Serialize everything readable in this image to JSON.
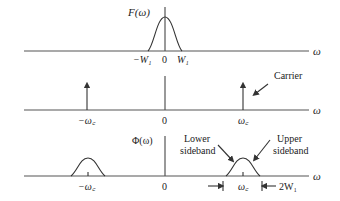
{
  "panels": [
    {
      "id": "baseband",
      "y_label": "F(ω)",
      "x_label": "ω",
      "ticks": [
        "−W₁",
        "0",
        "W₁"
      ]
    },
    {
      "id": "carrier",
      "x_label": "ω",
      "ticks": [
        "−ω꜀",
        "0",
        "ω꜀"
      ],
      "annotation": "Carrier"
    },
    {
      "id": "modulated",
      "y_label": "Φ(ω)",
      "x_label": "ω",
      "ticks": [
        "−ω꜀",
        "0",
        "ω꜀"
      ],
      "annotations": {
        "lower_line1": "Lower",
        "lower_line2": "sideband",
        "upper_line1": "Upper",
        "upper_line2": "sideband"
      },
      "bandwidth_label": "2W₁"
    }
  ]
}
